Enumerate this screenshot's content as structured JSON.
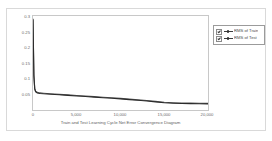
{
  "chart_data": {
    "type": "line",
    "title": "",
    "xlabel": "Train and Test Learning Cycle Net Error Convergence Diagram",
    "ylabel": "",
    "xlim": [
      0,
      20000
    ],
    "ylim": [
      0,
      0.325
    ],
    "grid": false,
    "legend_position": "top-right-outside",
    "xticks": [
      0,
      5000,
      10000,
      15000,
      20000
    ],
    "xtick_labels": [
      "0",
      "5,000",
      "10,000",
      "15,000",
      "20,000"
    ],
    "yticks": [
      0.05,
      0.1,
      0.15,
      0.2,
      0.25,
      0.3
    ],
    "ytick_labels": [
      "0.05",
      "0.1",
      "0.15",
      "0.2",
      "0.25",
      "0.3"
    ],
    "x": [
      0,
      100,
      200,
      300,
      500,
      800,
      1200,
      2000,
      3000,
      4000,
      5000,
      6000,
      7000,
      8000,
      9000,
      10000,
      11000,
      12000,
      13000,
      14000,
      15000,
      16000,
      17000,
      18000,
      19000,
      20000
    ],
    "series": [
      {
        "name": "RMS of Train",
        "color": "#2b2b2b",
        "values": [
          0.312,
          0.118,
          0.072,
          0.063,
          0.059,
          0.057,
          0.056,
          0.0545,
          0.0525,
          0.0505,
          0.0485,
          0.0465,
          0.0445,
          0.0425,
          0.0405,
          0.0385,
          0.036,
          0.0335,
          0.031,
          0.028,
          0.025,
          0.0235,
          0.0225,
          0.022,
          0.0215,
          0.021
        ]
      },
      {
        "name": "RMS of Test",
        "color": "#555555",
        "values": [
          0.314,
          0.121,
          0.074,
          0.065,
          0.061,
          0.059,
          0.058,
          0.0562,
          0.0542,
          0.0522,
          0.0502,
          0.0482,
          0.0462,
          0.0442,
          0.0422,
          0.0402,
          0.0377,
          0.0352,
          0.0327,
          0.0297,
          0.0267,
          0.0252,
          0.0242,
          0.0237,
          0.0232,
          0.0228
        ]
      }
    ]
  },
  "legend": {
    "items": [
      {
        "label": "RMS of Train",
        "checked": true
      },
      {
        "label": "RMS of Test",
        "checked": true
      }
    ]
  }
}
